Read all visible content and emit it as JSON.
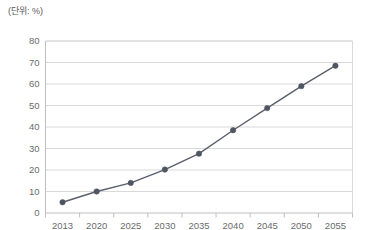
{
  "unit_label": "(단위: %)",
  "colors": {
    "series_line": "#595f6b",
    "marker": "#4f5662",
    "gridline": "#d9d9d9",
    "axis": "#bfbfbf",
    "tick_label": "#6b6b6b",
    "background": "#ffffff"
  },
  "chart_data": {
    "type": "line",
    "title": "",
    "subtitle": "",
    "xlabel": "",
    "ylabel": "",
    "unit": "(단위: %)",
    "categories": [
      "2013",
      "2020",
      "2025",
      "2030",
      "2035",
      "2040",
      "2045",
      "2050",
      "2055"
    ],
    "values": [
      5.0,
      10.0,
      14.0,
      20.2,
      27.6,
      38.5,
      48.8,
      59.0,
      68.5
    ],
    "series": [
      {
        "name": "",
        "values": [
          5.0,
          10.0,
          14.0,
          20.2,
          27.6,
          38.5,
          48.8,
          59.0,
          68.5
        ]
      }
    ],
    "ylim": [
      0,
      80
    ],
    "yticks": [
      0,
      10,
      20,
      30,
      40,
      50,
      60,
      70,
      80
    ],
    "ytick_labels": [
      "0",
      "10",
      "20",
      "30",
      "40",
      "50",
      "60",
      "70",
      "80"
    ],
    "xtick_labels": [
      "2013",
      "2020",
      "2025",
      "2030",
      "2035",
      "2040",
      "2045",
      "2050",
      "2055"
    ],
    "grid": true,
    "grid_axis": "y",
    "legend": false,
    "legend_position": "none",
    "markers": true,
    "marker_shape": "circle",
    "annotations": []
  }
}
